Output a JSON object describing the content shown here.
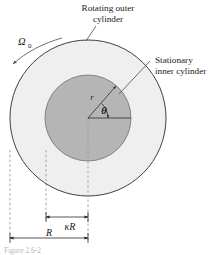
{
  "figure": {
    "type": "technical-diagram",
    "background_color": "#ffffff",
    "outer_fill_color": "#efefef",
    "inner_fill_color": "#b5b5b5",
    "line_color": "#2b2b2b",
    "dash_color": "#9a9a9a"
  },
  "labels": {
    "outer_cylinder_line1": "Rotating outer",
    "outer_cylinder_line2": "cylinder",
    "inner_cylinder_line1": "Stationary",
    "inner_cylinder_line2": "inner cylinder",
    "angular_velocity": "Ω",
    "angular_velocity_subscript": "0",
    "radial_coordinate": "r",
    "angular_coordinate": "θ",
    "inner_radius": "κR",
    "outer_radius": "R",
    "caption_partial": "Figure 2.6-2"
  },
  "geometry": {
    "center_x": 88,
    "center_y": 118,
    "outer_radius_px": 78,
    "inner_radius_px": 43,
    "r_arrow_angle_deg": 48,
    "theta_arc_radius_px": 20,
    "kappa_R_span_px": [
      46,
      88
    ],
    "R_span_px": [
      10,
      88
    ]
  }
}
